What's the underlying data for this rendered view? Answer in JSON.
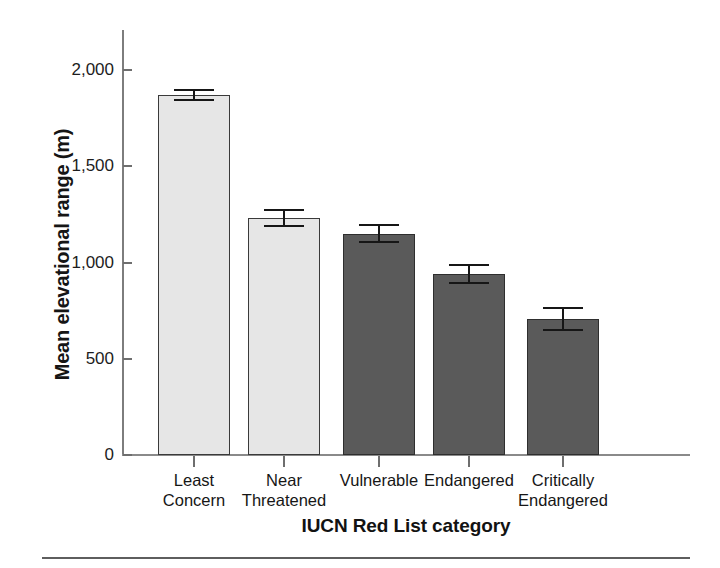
{
  "chart_data": {
    "type": "bar",
    "title": "",
    "xlabel": "IUCN Red List category",
    "ylabel": "Mean elevational range (m)",
    "categories": [
      "Least\nConcern",
      "Near\nThreatened",
      "Vulnerable",
      "Endangered",
      "Critically\nEndangered"
    ],
    "values": [
      1870,
      1230,
      1150,
      940,
      705
    ],
    "errors": [
      25,
      42,
      45,
      45,
      58
    ],
    "error_type": "standard error bars",
    "bar_colors": [
      "#e6e6e6",
      "#e6e6e6",
      "#5a5a5a",
      "#5a5a5a",
      "#5a5a5a"
    ],
    "ylim": [
      0,
      2100
    ],
    "yticks": [
      0,
      500,
      1000,
      1500,
      2000
    ],
    "ytick_labels": [
      "0",
      "500",
      "1,000",
      "1,500",
      "2,000"
    ],
    "grid": false,
    "legend": "none"
  },
  "axis": {
    "y_title": "Mean elevational range (m)",
    "x_title": "IUCN Red List category"
  },
  "colors": {
    "bar_light": "#e6e6e6",
    "bar_dark": "#5a5a5a",
    "bar_outline": "#3a3a3a",
    "axis": "#7d7d7d",
    "error": "#161616",
    "text": "#161616",
    "rule": "#5e5e5e"
  }
}
